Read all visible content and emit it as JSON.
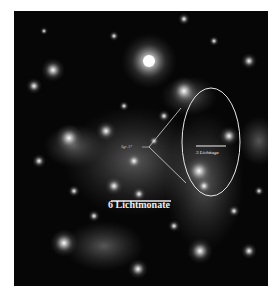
{
  "image": {
    "subject": "Galactic center star field (infrared)",
    "background_color": "#060606"
  },
  "annotations": {
    "scale_bar_large": "6 Lichtmonate",
    "scale_bar_small": "3 Lichttage",
    "pointer_label": "Sgr A*"
  },
  "colors": {
    "annotation": "#f0f0f0",
    "frame": "#ffffff"
  }
}
